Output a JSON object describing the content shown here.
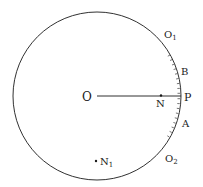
{
  "diagram": {
    "circle": {
      "cx": 97,
      "cy": 96,
      "r": 84
    },
    "labels": {
      "O": "O",
      "N": "N",
      "P": "P",
      "A": "A",
      "B": "B",
      "O1": "O",
      "O1_sub": "1",
      "O2": "O",
      "O2_sub": "2",
      "N1": "N",
      "N1_sub": "1"
    },
    "colors": {
      "stroke": "#1a1a1a",
      "background": "#ffffff"
    }
  }
}
